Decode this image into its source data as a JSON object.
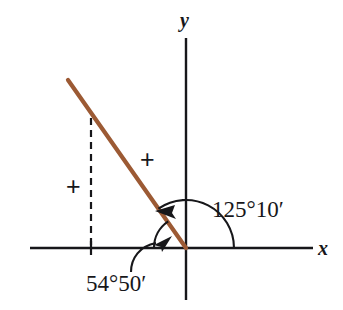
{
  "figure": {
    "background_color": "#ffffff",
    "width": 343,
    "height": 310
  },
  "axes": {
    "x_label": "x",
    "y_label": "y",
    "color": "#17171a",
    "origin": {
      "x": 186,
      "y": 248
    },
    "x_axis": {
      "start_x": 30,
      "end_x": 313,
      "y": 248
    },
    "y_axis": {
      "x": 186,
      "start_y": 38,
      "end_y": 300
    }
  },
  "ray": {
    "name": "terminal-side",
    "color": "#9c5a34",
    "from": {
      "x": 186,
      "y": 248
    },
    "to": {
      "x": 68,
      "y": 80
    },
    "width": 4
  },
  "dashed_line": {
    "name": "perpendicular-drop",
    "color": "#17171a",
    "x": 91,
    "from_y": 118,
    "to_y": 248,
    "dash": "7 5"
  },
  "tick": {
    "x": 91,
    "y_top": 241,
    "y_bottom": 255
  },
  "angles": [
    {
      "name": "standard-angle",
      "label": "125°10′",
      "degrees": 125,
      "minutes": 10,
      "arc_radius": 48,
      "direction": "counterclockwise",
      "from": "positive x-axis",
      "to": "terminal side",
      "arrow_at": {
        "x": 165,
        "y": 212
      }
    },
    {
      "name": "reference-angle",
      "label": "54°50′",
      "degrees": 54,
      "minutes": 50,
      "arc_radius": 32,
      "direction": "clockwise",
      "from": "negative x-axis",
      "to": "terminal side",
      "arrow_at": {
        "x": 167,
        "y": 242
      }
    }
  ],
  "sign_marks": [
    {
      "name": "plus-upper",
      "label": "+",
      "x": 147,
      "y": 160
    },
    {
      "name": "plus-lower",
      "label": "+",
      "x": 74,
      "y": 187
    }
  ]
}
